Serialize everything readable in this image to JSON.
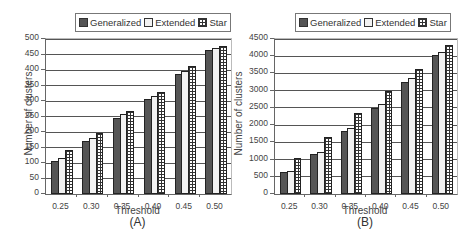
{
  "legend": {
    "items": [
      {
        "label": "Generalized",
        "pattern": "pat-gen"
      },
      {
        "label": "Extended",
        "pattern": "pat-ext"
      },
      {
        "label": "Star",
        "pattern": "pat-star"
      }
    ]
  },
  "charts": [
    {
      "id": "A",
      "sublabel": "(A)",
      "xlabel": "Threshold",
      "ylabel": "Number of clusters",
      "yticks": [
        "0",
        "50",
        "100",
        "150",
        "200",
        "250",
        "300",
        "350",
        "400",
        "450",
        "500"
      ],
      "xticks": [
        "0.25",
        "0.30",
        "0.35",
        "0.40",
        "0.45",
        "0.50"
      ]
    },
    {
      "id": "B",
      "sublabel": "(B)",
      "xlabel": "Threshold",
      "ylabel": "Number of clusters",
      "yticks": [
        "0",
        "500",
        "1000",
        "1500",
        "2000",
        "2500",
        "3000",
        "3500",
        "4000",
        "4500"
      ],
      "xticks": [
        "0.25",
        "0.30",
        "0.35",
        "0.40",
        "0.45",
        "0.50"
      ]
    }
  ],
  "chart_data": [
    {
      "type": "bar",
      "title": "(A)",
      "xlabel": "Threshold",
      "ylabel": "Number of clusters",
      "categories": [
        "0.25",
        "0.30",
        "0.35",
        "0.40",
        "0.45",
        "0.50"
      ],
      "series": [
        {
          "name": "Generalized",
          "values": [
            107,
            172,
            245,
            307,
            388,
            465
          ]
        },
        {
          "name": "Extended",
          "values": [
            115,
            180,
            258,
            315,
            398,
            470
          ]
        },
        {
          "name": "Star",
          "values": [
            142,
            198,
            267,
            330,
            413,
            478
          ]
        }
      ],
      "ylim": [
        0,
        500
      ],
      "ytick_step": 50,
      "grid": true,
      "legend_position": "top"
    },
    {
      "type": "bar",
      "title": "(B)",
      "xlabel": "Threshold",
      "ylabel": "Number of clusters",
      "categories": [
        "0.25",
        "0.30",
        "0.35",
        "0.40",
        "0.45",
        "0.50"
      ],
      "series": [
        {
          "name": "Generalized",
          "values": [
            640,
            1150,
            1840,
            2500,
            3260,
            4040
          ]
        },
        {
          "name": "Extended",
          "values": [
            660,
            1210,
            1920,
            2600,
            3360,
            4110
          ]
        },
        {
          "name": "Star",
          "values": [
            1060,
            1650,
            2340,
            3000,
            3640,
            4320
          ]
        }
      ],
      "ylim": [
        0,
        4500
      ],
      "ytick_step": 500,
      "grid": true,
      "legend_position": "top"
    }
  ]
}
